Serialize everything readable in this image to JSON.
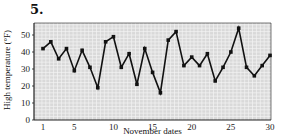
{
  "problem": {
    "number": "5."
  },
  "chart_data": {
    "type": "line",
    "title": "",
    "xlabel": "November dates",
    "ylabel": "High temperature (°F)",
    "x": [
      1,
      2,
      3,
      4,
      5,
      6,
      7,
      8,
      9,
      10,
      11,
      12,
      13,
      14,
      15,
      16,
      17,
      18,
      19,
      20,
      21,
      22,
      23,
      24,
      25,
      26,
      27,
      28,
      29,
      30
    ],
    "series": [
      {
        "name": "High temperature",
        "values": [
          42,
          46,
          36,
          42,
          29,
          41,
          31,
          19,
          46,
          49,
          31,
          39,
          21,
          42,
          28,
          16,
          47,
          52,
          32,
          37,
          32,
          39,
          23,
          31,
          40,
          54,
          31,
          26,
          32,
          38
        ]
      }
    ],
    "xticks": [
      1,
      5,
      10,
      15,
      20,
      25,
      30
    ],
    "yticks": [
      0,
      10,
      20,
      30,
      40,
      50
    ],
    "xlim": [
      0,
      30
    ],
    "ylim": [
      0,
      57
    ],
    "grid": true,
    "legend": null,
    "colors": {
      "line": "#111111",
      "marker": "#111111",
      "plot_bg": "#d9d9d9",
      "grid": "#f4f4f4",
      "axis": "#222222"
    }
  }
}
